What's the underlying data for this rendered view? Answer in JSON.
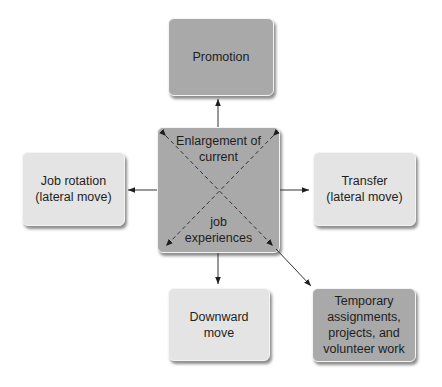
{
  "diagram": {
    "center": {
      "top_text": "Enlargement of\ncurrent",
      "bottom_text": "job\nexperiences",
      "color": "#a9a9a9"
    },
    "nodes": [
      {
        "id": "promotion",
        "text": "Promotion",
        "color": "#a9a9a9",
        "position": "top"
      },
      {
        "id": "job-rotation",
        "text": "Job rotation\n(lateral move)",
        "color": "#e4e4e4",
        "position": "left"
      },
      {
        "id": "transfer",
        "text": "Transfer\n(lateral move)",
        "color": "#e4e4e4",
        "position": "right"
      },
      {
        "id": "downward-move",
        "text": "Downward\nmove",
        "color": "#e4e4e4",
        "position": "bottom"
      },
      {
        "id": "temporary-assignments",
        "text": "Temporary\nassignments,\nprojects, and\nvolunteer work",
        "color": "#a9a9a9",
        "position": "bottom-right"
      }
    ],
    "edges": [
      {
        "from": "center",
        "to": "promotion"
      },
      {
        "from": "center",
        "to": "job-rotation"
      },
      {
        "from": "center",
        "to": "transfer"
      },
      {
        "from": "center",
        "to": "downward-move"
      },
      {
        "from": "center",
        "to": "temporary-assignments"
      }
    ]
  }
}
